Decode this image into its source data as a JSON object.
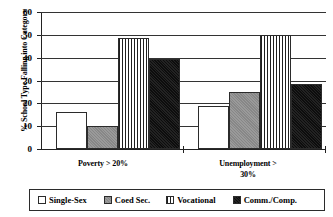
{
  "chart_data": {
    "type": "bar",
    "title": "",
    "xlabel": "",
    "ylabel": "% School Type Falling into Category",
    "categories": [
      "Poverty > 20%",
      "Unemployment > 30%"
    ],
    "category_lines": [
      [
        "Poverty > 20%"
      ],
      [
        "Unemployment >",
        "30%"
      ]
    ],
    "series": [
      {
        "name": "Single-Sex",
        "values": [
          16,
          19
        ],
        "swatch": "#ffffff",
        "pattern": "solid-white"
      },
      {
        "name": "Coed Sec.",
        "values": [
          10,
          25
        ],
        "swatch": "#8f8f8f",
        "pattern": "solid-gray"
      },
      {
        "name": "Vocational",
        "values": [
          48.5,
          50
        ],
        "swatch": "#ffffff",
        "pattern": "vertical-stripes"
      },
      {
        "name": "Comm./Comp.",
        "values": [
          39.5,
          28.5
        ],
        "swatch": "#0d0d0d",
        "pattern": "solid-black"
      }
    ],
    "ylim": [
      0,
      60
    ],
    "ytick_values": [
      0,
      10,
      20,
      30,
      40,
      50,
      60
    ],
    "ytick_labels": [
      "0",
      "10",
      "20",
      "30",
      "40",
      "50",
      "60"
    ],
    "grid": true,
    "legend_position": "bottom"
  }
}
